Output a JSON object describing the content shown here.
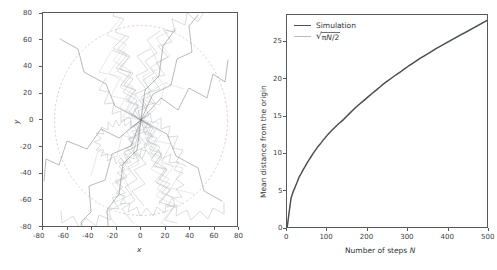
{
  "figure": {
    "type": "two-panel-figure",
    "background": "#ffffff",
    "panels": 2
  },
  "left_panel": {
    "xlabel": "x",
    "ylabel": "y",
    "xticks": [
      "-80",
      "-60",
      "-40",
      "-20",
      "0",
      "20",
      "40",
      "60",
      "80"
    ],
    "yticks": [
      "80",
      "60",
      "40",
      "20",
      "0",
      "-20",
      "-40",
      "-60",
      "-80"
    ]
  },
  "right_panel": {
    "xlabel": "Number of steps N",
    "ylabel": "Mean distance from the origin",
    "xticks": [
      "0",
      "100",
      "200",
      "300",
      "400",
      "500"
    ],
    "yticks": [
      "0",
      "5",
      "10",
      "15",
      "20",
      "25"
    ],
    "legend": {
      "items": [
        {
          "label": "Simulation",
          "color": "#4a4f53"
        },
        {
          "label": "sqrt(pi N / 2)",
          "color": "#b9bdc0",
          "formula_pi": "π",
          "formula_var": "N",
          "formula_den": "/2"
        }
      ]
    }
  },
  "chart_data": [
    {
      "type": "scatter",
      "title": "",
      "xlabel": "x",
      "ylabel": "y",
      "xlim": [
        -85,
        85
      ],
      "ylim": [
        -85,
        85
      ],
      "xticks": [
        -80,
        -60,
        -40,
        -20,
        0,
        20,
        40,
        60,
        80
      ],
      "yticks": [
        -80,
        -60,
        -40,
        -20,
        0,
        20,
        40,
        60,
        80
      ],
      "grid": false,
      "legend": "none",
      "description": "Many overlaid 2-D random-walk trajectories of 500 steps each, starting at the origin, drawn in translucent grey; a faint dashed circle of radius ~75 bounds the cloud.",
      "reference_circle_radius": 75,
      "n_walks": 60,
      "n_steps": 500,
      "colors": {
        "walk": "#7b8084",
        "circle": "#d9b8b8"
      }
    },
    {
      "type": "line",
      "title": "",
      "xlabel": "Number of steps N",
      "ylabel": "Mean distance from the origin",
      "xlim": [
        0,
        500
      ],
      "ylim": [
        0,
        28.6
      ],
      "xticks": [
        0,
        100,
        200,
        300,
        400,
        500
      ],
      "yticks": [
        0,
        5,
        10,
        15,
        20,
        25
      ],
      "grid": false,
      "legend": "upper left",
      "x": [
        0,
        10,
        20,
        30,
        40,
        50,
        60,
        70,
        80,
        90,
        100,
        120,
        140,
        160,
        180,
        200,
        220,
        240,
        260,
        280,
        300,
        320,
        340,
        360,
        380,
        400,
        420,
        440,
        460,
        480,
        500
      ],
      "series": [
        {
          "name": "Simulation",
          "color": "#4a4f53",
          "values": [
            0,
            4.1,
            5.6,
            6.9,
            7.9,
            8.8,
            9.7,
            10.4,
            11.0,
            11.6,
            12.3,
            13.5,
            14.6,
            15.4,
            16.2,
            17.1,
            17.9,
            18.8,
            19.6,
            20.3,
            21.0,
            21.8,
            22.5,
            23.1,
            23.7,
            24.4,
            25.1,
            25.8,
            26.5,
            27.2,
            27.9
          ]
        },
        {
          "name": "sqrt(pi N / 2)",
          "color": "#b9bdc0",
          "values": [
            0,
            3.96,
            5.6,
            6.86,
            7.92,
            8.86,
            9.71,
            10.49,
            11.21,
            11.89,
            12.53,
            13.73,
            14.83,
            15.85,
            16.81,
            17.72,
            18.59,
            19.42,
            20.22,
            20.98,
            21.71,
            22.42,
            23.11,
            23.78,
            24.43,
            25.07,
            25.69,
            26.29,
            26.88,
            27.46,
            28.02
          ]
        }
      ]
    }
  ]
}
